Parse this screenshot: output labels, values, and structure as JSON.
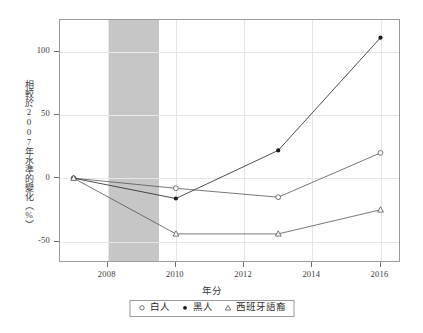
{
  "chart_data": {
    "type": "line",
    "title": "",
    "xlabel": "年分",
    "ylabel": "相較於2007年水準的變化（%）",
    "x": [
      2007,
      2010,
      2013,
      2016
    ],
    "xlim": [
      2006.6,
      2016.6
    ],
    "ylim": [
      -67,
      125
    ],
    "xticks": [
      2008,
      2010,
      2012,
      2014,
      2016
    ],
    "xtick_labels": [
      "2008",
      "2010",
      "2012",
      "2014",
      "2016"
    ],
    "yticks": [
      100,
      50,
      0,
      -50
    ],
    "ytick_labels": [
      "100",
      "50",
      "0",
      "-50"
    ],
    "grid": true,
    "legend_position": "bottom",
    "series": [
      {
        "name": "白人",
        "marker": "open-circle",
        "color": "#555555",
        "values": [
          0,
          -8,
          -15,
          20
        ]
      },
      {
        "name": "黑人",
        "marker": "filled-circle",
        "color": "#222222",
        "values": [
          0,
          -16,
          22,
          111
        ]
      },
      {
        "name": "西班牙語裔",
        "marker": "open-triangle",
        "color": "#555555",
        "values": [
          0,
          -44,
          -44,
          -25
        ]
      }
    ],
    "annotations": [
      {
        "type": "shaded-band",
        "label": "recession-band",
        "x_start": 2008.0,
        "x_end": 2009.5,
        "color": "#c6c6c6"
      }
    ]
  },
  "axes": {
    "y_title": "相較於2007年水準的變化（%）",
    "x_title": "年分"
  },
  "legend": {
    "entries": [
      {
        "marker": "open-circle",
        "label": "白人"
      },
      {
        "marker": "filled-circle",
        "label": "黑人"
      },
      {
        "marker": "open-triangle",
        "label": "西班牙語裔"
      }
    ]
  },
  "colors": {
    "frame": "#9a9a9a",
    "grid": "#e6e6e6",
    "band": "#c6c6c6",
    "line": "#555555",
    "text": "#2b2b2b"
  }
}
